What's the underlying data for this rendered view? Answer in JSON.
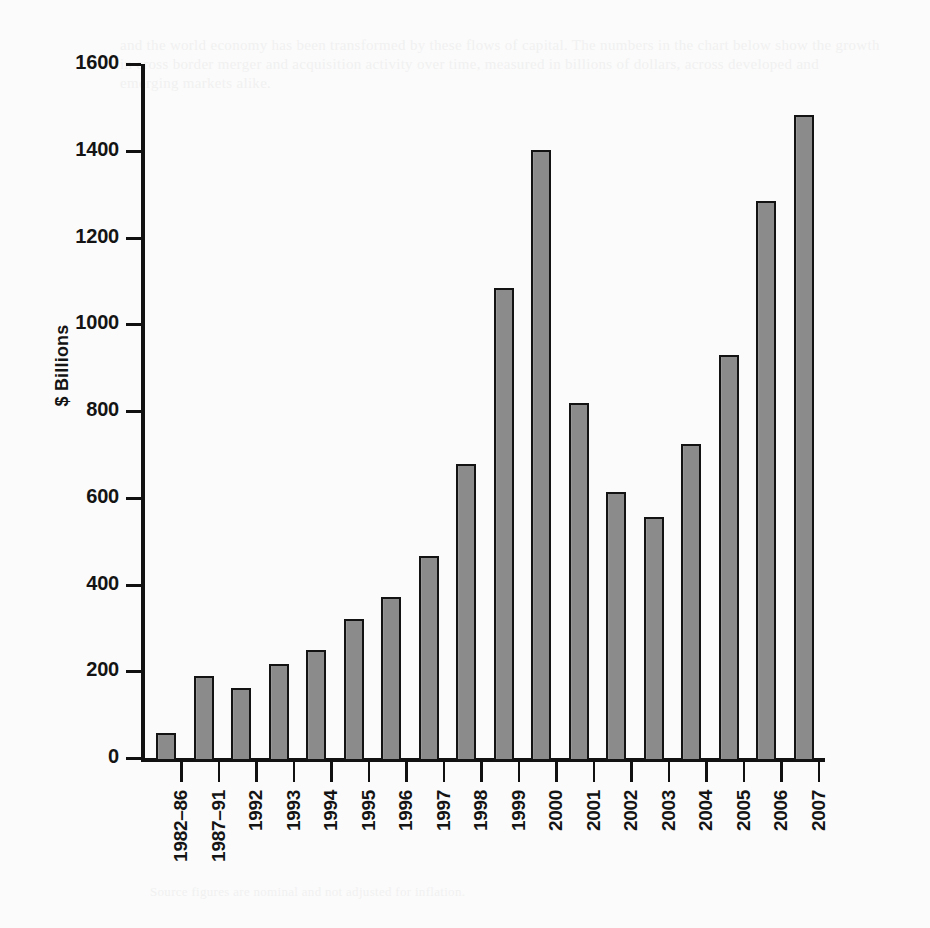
{
  "figure": {
    "background_color": "#fbfbfb",
    "bar_fill_color": "#8b8b8b",
    "bar_edge_color": "#131313",
    "axis_color": "#111111"
  },
  "bleed_through": {
    "top": "and the world economy has been transformed by these flows of capital. The numbers in the chart below show the growth in cross border merger and acquisition activity over time, measured in billions of dollars, across developed and emerging markets alike.",
    "bottom": "Source figures are nominal and not adjusted for inflation."
  },
  "chart_data": {
    "type": "bar",
    "title": "",
    "subtitle": "",
    "xlabel": "",
    "ylabel": "$ Billions",
    "ylim": [
      0,
      1600
    ],
    "yticks": [
      0,
      200,
      400,
      600,
      800,
      1000,
      1200,
      1400,
      1600
    ],
    "ytick_labels": [
      "0",
      "200",
      "400",
      "600",
      "800",
      "1000",
      "1200",
      "1400",
      "1600"
    ],
    "grid": false,
    "legend": null,
    "categories": [
      "1982–86",
      "1987–91",
      "1992",
      "1993",
      "1994",
      "1995",
      "1996",
      "1997",
      "1998",
      "1999",
      "2000",
      "2001",
      "2002",
      "2003",
      "2004",
      "2005",
      "2006",
      "2007"
    ],
    "values": [
      64,
      196,
      168,
      224,
      256,
      328,
      378,
      472,
      684,
      1090,
      1408,
      826,
      620,
      562,
      732,
      936,
      1292,
      1490
    ]
  }
}
